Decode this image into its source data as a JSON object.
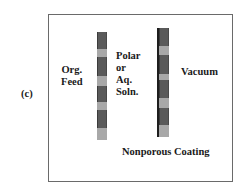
{
  "panel_label": "(c)",
  "labels": {
    "org_feed": "Org.\nFeed",
    "polar_soln": "Polar\nor\nAq.\nSoln.",
    "vacuum": "Vacuum",
    "coating": "Nonporous Coating"
  },
  "colors": {
    "dark_segment": "#5a5a5a",
    "light_segment": "#a8a8a8",
    "coating_line": "#1e1e1e",
    "frame": "#6a6a6a"
  },
  "membranes": [
    {
      "name": "support-membrane-left",
      "segments": [
        "dark",
        "light",
        "dark",
        "light",
        "dark",
        "light",
        "dark",
        "light"
      ]
    },
    {
      "name": "coated-membrane-right",
      "has_coating": true,
      "segments": [
        "dark",
        "light",
        "dark",
        "light",
        "dark",
        "light",
        "dark",
        "light"
      ]
    }
  ]
}
